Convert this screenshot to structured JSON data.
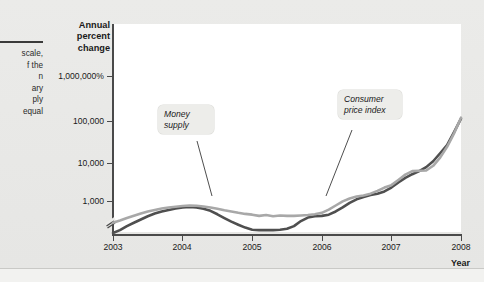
{
  "figure": {
    "caption_lines": [
      "scale,",
      "f the",
      "n",
      "ary",
      "ply",
      "equal"
    ]
  },
  "axes": {
    "y_title": "Annual percent change",
    "x_title": "Year",
    "y_ticks": [
      "1,000,000%",
      "100,000",
      "10,000",
      "1,000"
    ],
    "x_ticks": [
      "2003",
      "2004",
      "2005",
      "2006",
      "2007",
      "2008"
    ]
  },
  "callouts": {
    "money": "Money supply",
    "cpi": "Consumer price index"
  },
  "colors": {
    "money_supply": "#4f4f4f",
    "consumer_price_index": "#a8a8a8",
    "plot_background": "#ffffff",
    "page_background": "#e8e8e6",
    "axis": "#4a4a4a"
  },
  "chart_data": {
    "type": "line",
    "title": "",
    "xlabel": "Year",
    "ylabel": "Annual percent change",
    "x_scale": "linear",
    "y_scale": "log",
    "grid": false,
    "legend": "annotated-callouts",
    "axis_break_y": true,
    "xlim": [
      2003,
      2008
    ],
    "ylim_ticks": [
      1000,
      10000,
      100000,
      1000000
    ],
    "y_tick_labels": [
      "1,000",
      "10,000",
      "100,000",
      "1,000,000%"
    ],
    "x": [
      2003.0,
      2003.1,
      2003.2,
      2003.3,
      2003.4,
      2003.5,
      2003.6,
      2003.7,
      2003.8,
      2003.9,
      2004.0,
      2004.1,
      2004.2,
      2004.3,
      2004.4,
      2004.5,
      2004.6,
      2004.7,
      2004.8,
      2004.9,
      2005.0,
      2005.1,
      2005.2,
      2005.3,
      2005.4,
      2005.5,
      2005.6,
      2005.7,
      2005.8,
      2005.9,
      2006.0,
      2006.1,
      2006.2,
      2006.3,
      2006.4,
      2006.5,
      2006.6,
      2006.7,
      2006.8,
      2006.9,
      2007.0,
      2007.1,
      2007.2,
      2007.3,
      2007.4,
      2007.5,
      2007.6,
      2007.7,
      2007.8,
      2007.9,
      2008.0
    ],
    "series": [
      {
        "name": "Money supply",
        "color": "#4f4f4f",
        "values": [
          170,
          200,
          250,
          300,
          360,
          430,
          500,
          560,
          610,
          660,
          700,
          720,
          700,
          650,
          580,
          480,
          390,
          320,
          270,
          230,
          205,
          200,
          200,
          200,
          205,
          215,
          250,
          330,
          400,
          430,
          440,
          470,
          560,
          700,
          900,
          1100,
          1250,
          1400,
          1500,
          1700,
          2100,
          2800,
          3600,
          4400,
          5200,
          6500,
          9000,
          14000,
          22000,
          45000,
          95000
        ]
      },
      {
        "name": "Consumer price index",
        "color": "#a8a8a8",
        "values": [
          300,
          340,
          390,
          440,
          500,
          560,
          610,
          660,
          700,
          730,
          760,
          780,
          770,
          740,
          700,
          650,
          600,
          560,
          520,
          490,
          470,
          440,
          460,
          430,
          450,
          440,
          440,
          450,
          460,
          480,
          520,
          620,
          780,
          980,
          1150,
          1280,
          1350,
          1500,
          1750,
          2100,
          2400,
          3200,
          4300,
          5200,
          5300,
          5400,
          7000,
          11000,
          20000,
          42000,
          100000
        ]
      }
    ]
  }
}
